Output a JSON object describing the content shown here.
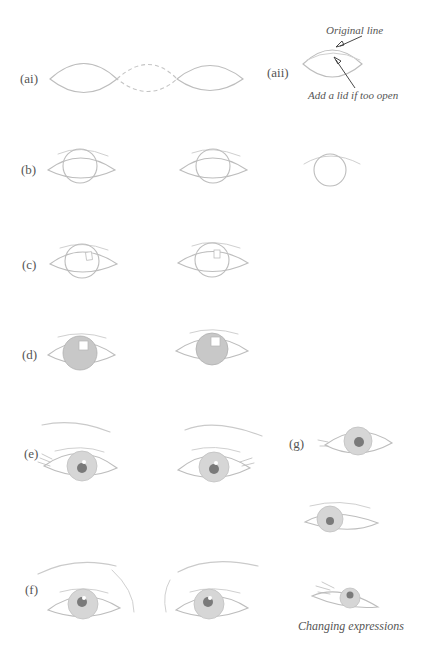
{
  "figure": {
    "step_labels": {
      "ai": "(ai)",
      "aii": "(aii)",
      "b": "(b)",
      "c": "(c)",
      "d": "(d)",
      "e": "(e)",
      "f": "(f)",
      "g": "(g)"
    },
    "annotations": {
      "original_line": "Original line",
      "add_lid": "Add a lid if too open",
      "changing_expressions": "Changing expressions"
    },
    "colors": {
      "pencil": "#bdbdbd",
      "shading": "#c8c8c8",
      "pupil": "#7a7a7a",
      "text": "#555555"
    }
  }
}
